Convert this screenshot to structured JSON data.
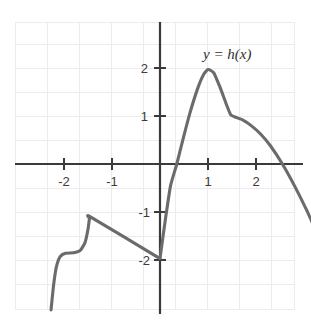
{
  "chart_data": {
    "type": "line",
    "title": "",
    "subtitle": "",
    "xlabel": "",
    "ylabel": "",
    "xlim": [
      -2.27,
      2.11
    ],
    "ylim": [
      -3.04,
      2.96
    ],
    "grid": true,
    "grid_step": 0.5,
    "legend_position": "inline-annotation",
    "x_ticks": [
      -2,
      -1,
      1,
      2
    ],
    "x_tick_labels": [
      "-2",
      "-1",
      "1",
      "2"
    ],
    "y_ticks": [
      2,
      1,
      -1,
      -2
    ],
    "y_tick_labels": [
      "2",
      "1",
      "-1",
      "-2"
    ],
    "annotations": [
      {
        "text": "y = h(x)",
        "x": 1.35,
        "y": 2.5
      }
    ],
    "series": [
      {
        "name": "h(x) left branch",
        "description": "Rises from lower-left, flattens near y = -1.85, sharp corner peak at (-2, -1.1), then straight decline to (0, -2)",
        "points": [
          {
            "x": -2.27,
            "y": -3.04
          },
          {
            "x": -2.22,
            "y": -2.55
          },
          {
            "x": -2.16,
            "y": -2.15
          },
          {
            "x": -2.08,
            "y": -1.93
          },
          {
            "x": -1.97,
            "y": -1.86
          },
          {
            "x": -1.8,
            "y": -1.85
          },
          {
            "x": -1.66,
            "y": -1.8
          },
          {
            "x": -1.56,
            "y": -1.63
          },
          {
            "x": -1.5,
            "y": -1.36
          },
          {
            "x": -1.47,
            "y": -1.14
          },
          {
            "x": -1.45,
            "y": -1.1
          },
          {
            "x": 0.0,
            "y": -1.97
          }
        ]
      },
      {
        "name": "h(x) right branch",
        "description": "Rises steeply from (0, -2), crosses zero near x = 0.35, peaks at (1, 2), kink shoulder at (1.5, 1), falls crossing zero near x = 2.55, ends at y = -1.3",
        "points": [
          {
            "x": 0.0,
            "y": -1.97
          },
          {
            "x": 0.12,
            "y": -1.1
          },
          {
            "x": 0.22,
            "y": -0.45
          },
          {
            "x": 0.35,
            "y": 0.0
          },
          {
            "x": 0.48,
            "y": 0.52
          },
          {
            "x": 0.62,
            "y": 1.05
          },
          {
            "x": 0.78,
            "y": 1.56
          },
          {
            "x": 0.9,
            "y": 1.85
          },
          {
            "x": 1.0,
            "y": 1.97
          },
          {
            "x": 1.12,
            "y": 1.9
          },
          {
            "x": 1.25,
            "y": 1.6
          },
          {
            "x": 1.38,
            "y": 1.25
          },
          {
            "x": 1.47,
            "y": 1.03
          },
          {
            "x": 1.56,
            "y": 0.98
          },
          {
            "x": 1.72,
            "y": 0.92
          },
          {
            "x": 1.9,
            "y": 0.8
          },
          {
            "x": 2.1,
            "y": 0.62
          },
          {
            "x": 2.3,
            "y": 0.38
          },
          {
            "x": 2.55,
            "y": 0.0
          },
          {
            "x": 2.8,
            "y": -0.45
          },
          {
            "x": 3.05,
            "y": -0.95
          },
          {
            "x": 3.2,
            "y": -1.28
          }
        ]
      }
    ],
    "key_features": {
      "left_peak": {
        "x": -2,
        "y": -1.1
      },
      "left_plateau_y": -1.85,
      "junction_point": {
        "x": 0,
        "y": -2
      },
      "global_max": {
        "x": 1,
        "y": 2
      },
      "shoulder_kink": {
        "x": 1.5,
        "y": 1
      },
      "zero_crossings": [
        0.35,
        2.55
      ]
    },
    "colors": {
      "curve": "#6b6b6b",
      "axis": "#3a3a3a",
      "grid": "#ececf0",
      "label": "#2e2e2e",
      "background": "#ffffff"
    }
  }
}
